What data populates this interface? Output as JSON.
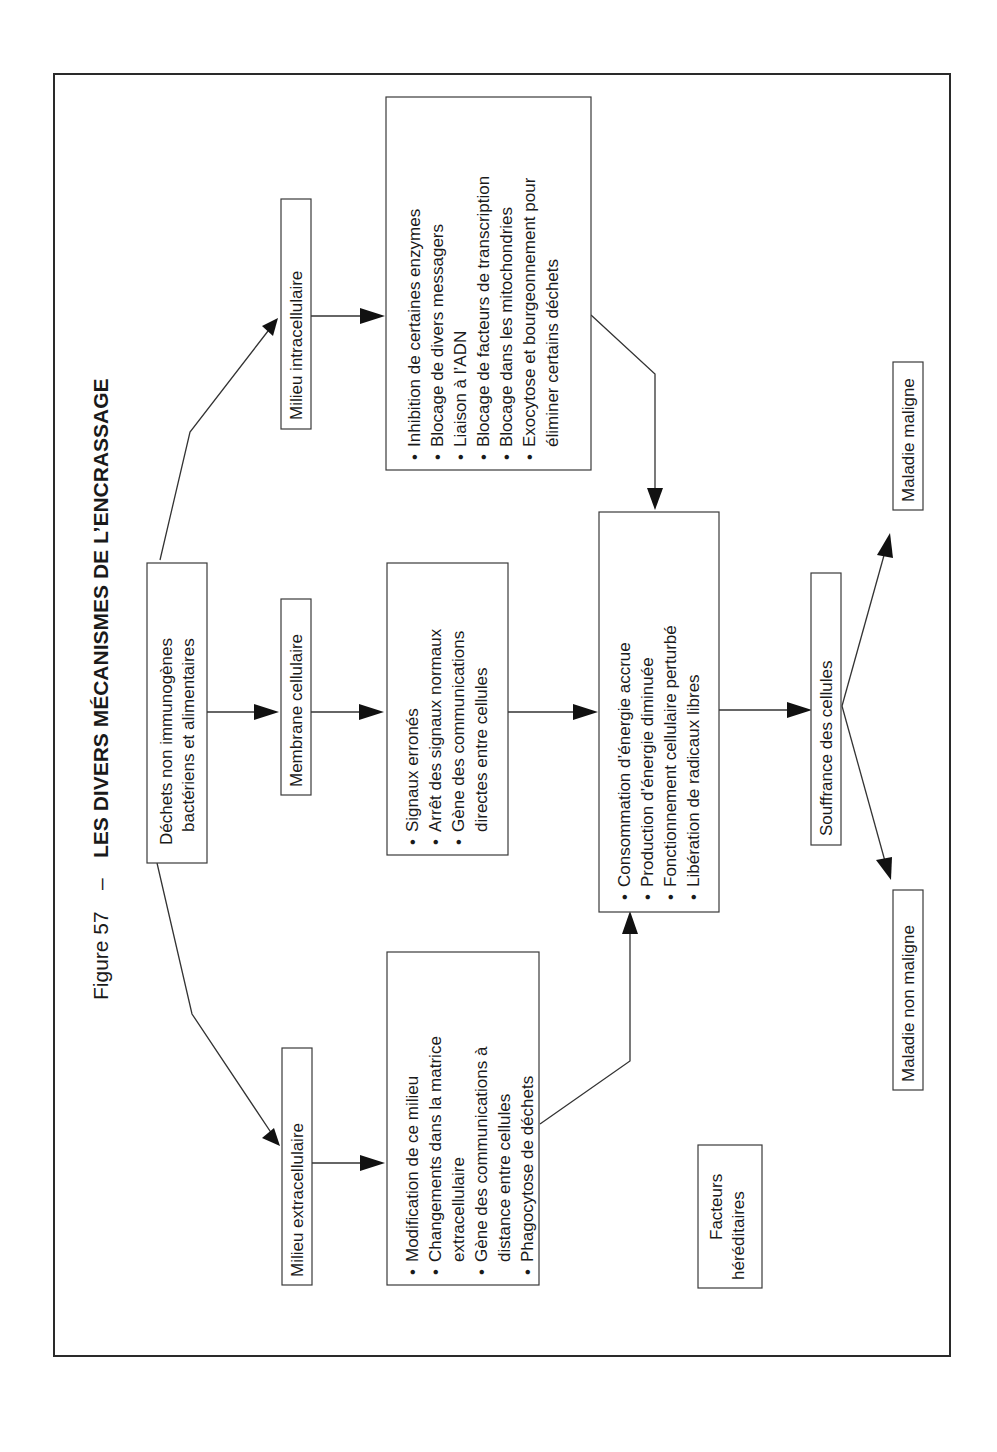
{
  "figure": {
    "number_label": "Figure 57",
    "separator": "–",
    "title": "LES DIVERS MÉCANISMES DE L’ENCRASSAGE"
  },
  "nodes": {
    "source": {
      "lines": [
        "Déchets non immunogènes",
        "bactériens et alimentaires"
      ]
    },
    "milieu_intracellulaire": {
      "label": "Milieu intracellulaire"
    },
    "membrane_cellulaire": {
      "label": "Membrane cellulaire"
    },
    "milieu_extracellulaire": {
      "label": "Milieu extracellulaire"
    },
    "intracellular_effects": {
      "items": [
        "Inhibition de certaines enzymes",
        "Blocage de divers messagers",
        "Liaison à l’ADN",
        "Blocage de facteurs de transcription",
        "Blocage dans les mitochondries",
        "Exocytose et bourgeonnement pour",
        "éliminer certains déchets"
      ],
      "bullets": [
        true,
        true,
        true,
        true,
        true,
        true,
        false
      ]
    },
    "membrane_effects": {
      "items": [
        "Signaux erronés",
        "Arrêt des signaux normaux",
        "Gène des communications",
        "directes entre cellules"
      ],
      "bullets": [
        true,
        true,
        true,
        false
      ]
    },
    "extracellular_effects": {
      "items": [
        "Modification de ce milieu",
        "Changements dans la matrice",
        "extracellulaire",
        "Gène des communications à",
        "distance entre cellules",
        "Phagocytose de déchets"
      ],
      "bullets": [
        true,
        true,
        false,
        true,
        false,
        true
      ]
    },
    "energy_effects": {
      "items": [
        "Consommation d’énergie accrue",
        "Production d’énergie diminuée",
        "Fonctionnement cellulaire perturbé",
        "Libération de radicaux libres"
      ],
      "bullets": [
        true,
        true,
        true,
        true
      ]
    },
    "souffrance": {
      "label": "Souffrance des cellules"
    },
    "maladie_maligne": {
      "label": "Maladie maligne"
    },
    "maladie_non_maligne": {
      "label": "Maladie non maligne"
    },
    "facteurs": {
      "lines": [
        "Facteurs",
        "héréditaires"
      ]
    }
  },
  "bullet_glyph": "•",
  "colors": {
    "ink": "#1a1a1a",
    "paper": "#ffffff"
  }
}
